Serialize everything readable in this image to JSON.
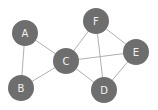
{
  "diagram": {
    "type": "undirected-graph",
    "colors": {
      "node": "#6e6e6e",
      "edge": "#b0b0b0",
      "label": "#f2f2f2",
      "background": "#ffffff"
    },
    "nodes": [
      {
        "id": "A",
        "label": "A",
        "x": 25,
        "y": 33
      },
      {
        "id": "B",
        "label": "B",
        "x": 21,
        "y": 88
      },
      {
        "id": "C",
        "label": "C",
        "x": 66,
        "y": 61
      },
      {
        "id": "D",
        "label": "D",
        "x": 104,
        "y": 90
      },
      {
        "id": "E",
        "label": "E",
        "x": 136,
        "y": 52
      },
      {
        "id": "F",
        "label": "F",
        "x": 96,
        "y": 21
      }
    ],
    "edges": [
      [
        "A",
        "B"
      ],
      [
        "A",
        "C"
      ],
      [
        "B",
        "C"
      ],
      [
        "C",
        "F"
      ],
      [
        "C",
        "E"
      ],
      [
        "C",
        "D"
      ],
      [
        "F",
        "E"
      ],
      [
        "F",
        "D"
      ],
      [
        "E",
        "D"
      ]
    ]
  }
}
